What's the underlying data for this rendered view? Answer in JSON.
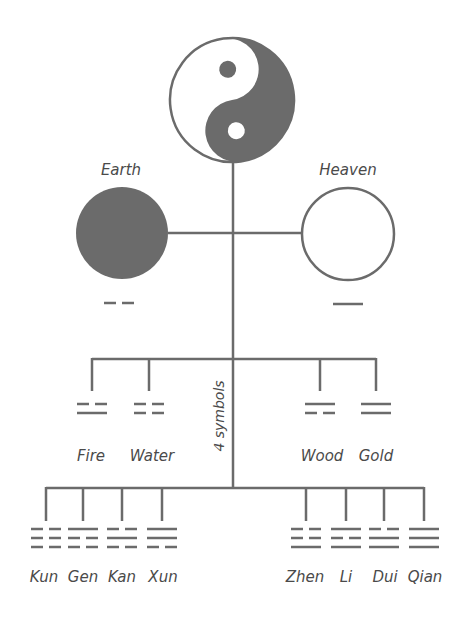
{
  "colors": {
    "ink": "#6b6b6b",
    "text": "#4a4a4a",
    "background": "#ffffff"
  },
  "top": {
    "symbol": "yin-yang"
  },
  "two_forms": [
    {
      "label": "Earth",
      "fill": "dark",
      "line": "broken"
    },
    {
      "label": "Heaven",
      "fill": "white",
      "line": "solid"
    }
  ],
  "four_symbols": {
    "caption": "4 symbols",
    "items": [
      {
        "label": "Fire",
        "lines": [
          "broken",
          "solid"
        ]
      },
      {
        "label": "Water",
        "lines": [
          "broken",
          "broken"
        ]
      },
      {
        "label": "Wood",
        "lines": [
          "solid",
          "broken"
        ]
      },
      {
        "label": "Gold",
        "lines": [
          "solid",
          "solid"
        ]
      }
    ]
  },
  "eight_trigrams": [
    {
      "label": "Kun",
      "lines": [
        "broken",
        "broken",
        "broken"
      ]
    },
    {
      "label": "Gen",
      "lines": [
        "solid",
        "broken",
        "broken"
      ]
    },
    {
      "label": "Kan",
      "lines": [
        "broken",
        "solid",
        "broken"
      ]
    },
    {
      "label": "Xun",
      "lines": [
        "solid",
        "solid",
        "broken"
      ]
    },
    {
      "label": "Zhen",
      "lines": [
        "broken",
        "broken",
        "solid"
      ]
    },
    {
      "label": "Li",
      "lines": [
        "solid",
        "broken",
        "solid"
      ]
    },
    {
      "label": "Dui",
      "lines": [
        "broken",
        "solid",
        "solid"
      ]
    },
    {
      "label": "Qian",
      "lines": [
        "solid",
        "solid",
        "solid"
      ]
    }
  ]
}
